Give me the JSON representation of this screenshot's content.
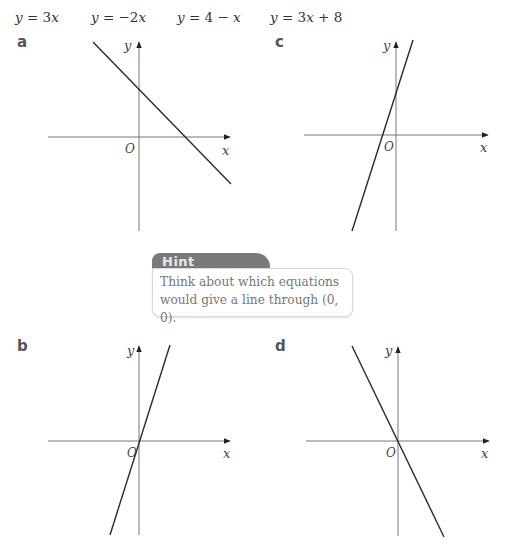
{
  "equations": [
    "y = 3x",
    "y = −2x",
    "y = 4 − x",
    "y = 3x + 8"
  ],
  "graphs": [
    {
      "label": "a",
      "axis_x": "x",
      "axis_y": "y",
      "origin": "O",
      "matches_line": "decreasing, positive y-intercept"
    },
    {
      "label": "c",
      "axis_x": "x",
      "axis_y": "y",
      "origin": "O",
      "matches_line": "steep increasing, positive y-intercept"
    },
    {
      "label": "b",
      "axis_x": "x",
      "axis_y": "y",
      "origin": "O",
      "matches_line": "increasing through origin"
    },
    {
      "label": "d",
      "axis_x": "x",
      "axis_y": "y",
      "origin": "O",
      "matches_line": "decreasing through origin"
    }
  ],
  "hint": {
    "title": "Hint",
    "text": "Think about which equations would give a line through (0, 0)."
  },
  "colors": {
    "axis": "#777777",
    "line": "#2a2a2a",
    "hint_tab": "#7a7a7a",
    "hint_text": "#777777"
  },
  "chart_data": [
    {
      "type": "line",
      "title": "a",
      "xlabel": "x",
      "ylabel": "y",
      "description": "Line with negative gradient crossing y-axis above origin and x-axis at positive x",
      "grid": false
    },
    {
      "type": "line",
      "title": "c",
      "xlabel": "x",
      "ylabel": "y",
      "description": "Steep line with positive gradient crossing y-axis above origin and x-axis at negative x",
      "grid": false
    },
    {
      "type": "line",
      "title": "b",
      "xlabel": "x",
      "ylabel": "y",
      "description": "Line with positive gradient passing through origin",
      "grid": false
    },
    {
      "type": "line",
      "title": "d",
      "xlabel": "x",
      "ylabel": "y",
      "description": "Line with negative gradient passing through origin",
      "grid": false
    }
  ]
}
